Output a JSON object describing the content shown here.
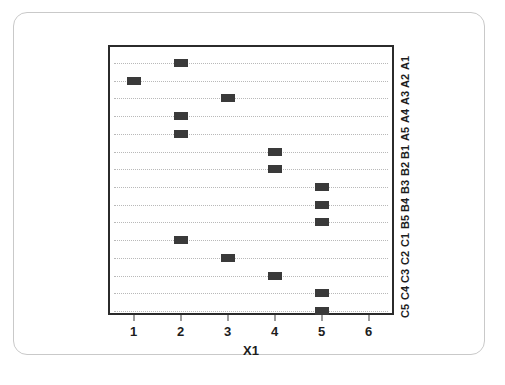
{
  "chart_data": {
    "type": "scatter",
    "title": "",
    "subtitle": "",
    "xlabel": "X1",
    "ylabel": "",
    "xlim": [
      0.5,
      6.5
    ],
    "xticks": [
      1,
      2,
      3,
      4,
      5,
      6
    ],
    "xtick_labels": [
      "1",
      "2",
      "3",
      "4",
      "5",
      "6"
    ],
    "categories": [
      "A1",
      "A2",
      "A3",
      "A4",
      "A5",
      "B1",
      "B2",
      "B3",
      "B4",
      "B5",
      "C1",
      "C2",
      "C3",
      "C4",
      "C5"
    ],
    "values": [
      2,
      1,
      3,
      2,
      2,
      4,
      4,
      5,
      5,
      5,
      2,
      3,
      4,
      5,
      5
    ],
    "points": [
      {
        "category": "A1",
        "x": 2
      },
      {
        "category": "A2",
        "x": 1
      },
      {
        "category": "A3",
        "x": 3
      },
      {
        "category": "A4",
        "x": 2
      },
      {
        "category": "A5",
        "x": 2
      },
      {
        "category": "B1",
        "x": 4
      },
      {
        "category": "B2",
        "x": 4
      },
      {
        "category": "B3",
        "x": 5
      },
      {
        "category": "B4",
        "x": 5
      },
      {
        "category": "B5",
        "x": 5
      },
      {
        "category": "C1",
        "x": 2
      },
      {
        "category": "C2",
        "x": 3
      },
      {
        "category": "C3",
        "x": 4
      },
      {
        "category": "C4",
        "x": 5
      },
      {
        "category": "C5",
        "x": 5
      }
    ],
    "grid": true,
    "grid_axis": "y",
    "grid_style": "dotted",
    "legend": false,
    "legend_position": "none",
    "category_label_position": "right",
    "category_label_rotation": -90,
    "marker_shape": "rectangle",
    "marker_color": "#3a3a3a",
    "grid_color": "#b9b9b9",
    "axis_color": "#2b2b2b",
    "text_color": "#1d1d1d",
    "background_color": "#ffffff",
    "frame_border_color": "#c9c9c9"
  }
}
